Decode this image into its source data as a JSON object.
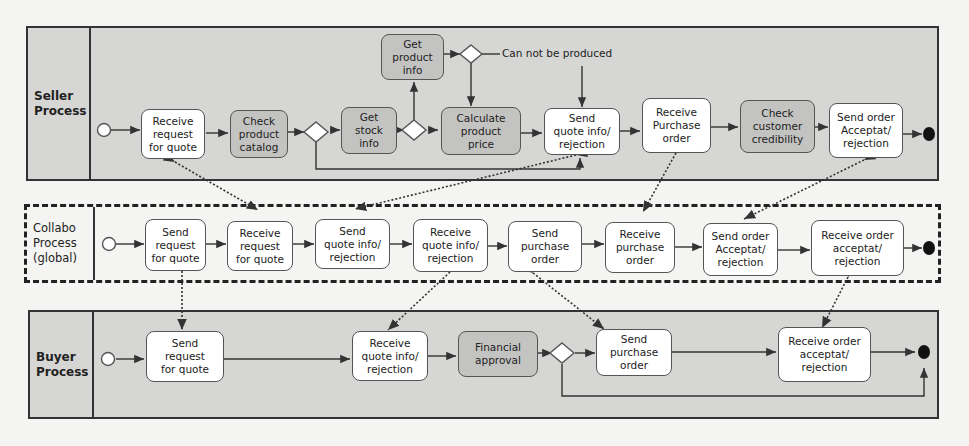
{
  "pools": {
    "seller": {
      "label": "Seller\nProcess"
    },
    "collabo": {
      "label": "Collabo\nProcess\n(global)"
    },
    "buyer": {
      "label": "Buyer\nProcess"
    }
  },
  "seller_tasks": [
    {
      "id": "s1",
      "label": "Receive\nrequest\nfor quote"
    },
    {
      "id": "s2",
      "label": "Check\nproduct\ncatalog"
    },
    {
      "id": "s3",
      "label": "Get\nstock\ninfo"
    },
    {
      "id": "s4",
      "label": "Get\nproduct\ninfo"
    },
    {
      "id": "s5",
      "label": "Calculate\nproduct\nprice"
    },
    {
      "id": "s6",
      "label": "Send\nquote info/\nrejection"
    },
    {
      "id": "s7",
      "label": "Receive\nPurchase\norder"
    },
    {
      "id": "s8",
      "label": "Check\ncustomer\ncredibility"
    },
    {
      "id": "s9",
      "label": "Send order\nAcceptat/\nrejection"
    }
  ],
  "seller_note": "Can not be produced",
  "collabo_tasks": [
    {
      "id": "c1",
      "label": "Send\nrequest\nfor quote"
    },
    {
      "id": "c2",
      "label": "Receive\nrequest\nfor quote"
    },
    {
      "id": "c3",
      "label": "Send\nquote info/\nrejection"
    },
    {
      "id": "c4",
      "label": "Receive\nquote info/\nrejection"
    },
    {
      "id": "c5",
      "label": "Send\npurchase\norder"
    },
    {
      "id": "c6",
      "label": "Receive\npurchase\norder"
    },
    {
      "id": "c7",
      "label": "Send order\nAcceptat/\nrejection"
    },
    {
      "id": "c8",
      "label": "Receive order\nacceptat/\nrejection"
    }
  ],
  "buyer_tasks": [
    {
      "id": "b1",
      "label": "Send\nrequest\nfor quote"
    },
    {
      "id": "b2",
      "label": "Receive\nquote info/\nrejection"
    },
    {
      "id": "b3",
      "label": "Financial\napproval"
    },
    {
      "id": "b4",
      "label": "Send\npurchase\norder"
    },
    {
      "id": "b5",
      "label": "Receive order\nacceptat/\nrejection"
    }
  ],
  "colors": {
    "pool_fill": "#d6d6d4",
    "task_white": "#ffffff",
    "task_grey": "#c3c3c1",
    "line": "#333333"
  }
}
